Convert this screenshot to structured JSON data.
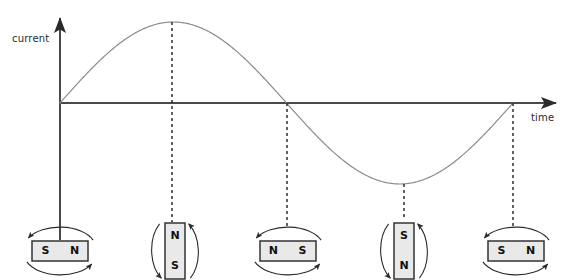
{
  "figure": {
    "background": "#ffffff",
    "width": 578,
    "height": 280
  },
  "axes": {
    "y_label": "current",
    "x_label": "time",
    "origin": {
      "x": 60,
      "y": 103
    },
    "x_axis_end": {
      "x": 562,
      "y": 103
    },
    "y_axis_top": {
      "x": 60,
      "y": 14
    },
    "y_axis_bottom": {
      "x": 60,
      "y": 240
    },
    "axis_color": "#4a4a4a",
    "axis_width": 2,
    "arrow_color": "#2b2b2b"
  },
  "chart_data": {
    "type": "line",
    "xlabel": "time",
    "ylabel": "current",
    "grid": false,
    "legend": null,
    "xlim": [
      0,
      360
    ],
    "ylim": [
      -1,
      1
    ],
    "x_tick_labels": [],
    "y_tick_labels": [],
    "curve_color": "#8a8a8a",
    "curve_width": 1.2,
    "series": [
      {
        "name": "current",
        "function": "sine",
        "amplitude": 1,
        "cycles": 1,
        "phase_deg": 0,
        "x": [
          0,
          45,
          90,
          135,
          180,
          225,
          270,
          315,
          360
        ],
        "y": [
          0,
          0.707,
          1,
          0.707,
          0,
          -0.707,
          -1,
          -0.707,
          0
        ]
      }
    ],
    "key_points": [
      {
        "label": "zero-rising",
        "x_deg": 0,
        "value": 0,
        "px": [
          60,
          103
        ]
      },
      {
        "label": "peak",
        "x_deg": 90,
        "value": 1,
        "px": [
          172,
          22
        ]
      },
      {
        "label": "zero-falling",
        "x_deg": 180,
        "value": 0,
        "px": [
          287,
          103
        ]
      },
      {
        "label": "trough",
        "x_deg": 270,
        "value": -1,
        "px": [
          404,
          184
        ]
      },
      {
        "label": "zero-rising",
        "x_deg": 360,
        "value": 0,
        "px": [
          513,
          103
        ]
      }
    ]
  },
  "dashed_guides": {
    "color": "#1f1f1f",
    "dash": "3,3",
    "lines": [
      {
        "x": 172,
        "y_from": 22,
        "y_to": 222
      },
      {
        "x": 287,
        "y_from": 103,
        "y_to": 228
      },
      {
        "x": 404,
        "y_from": 184,
        "y_to": 218
      },
      {
        "x": 513,
        "y_from": 103,
        "y_to": 228
      }
    ]
  },
  "magnet_style": {
    "fill": "#e9e9e9",
    "border": "#333333",
    "border_width": 1.5,
    "arrow_color": "#2b2b2b",
    "rotation": "clockwise"
  },
  "magnets": [
    {
      "id": "magnet-0deg",
      "orientation": "horizontal",
      "angle_deg": 0,
      "left_pole": "S",
      "right_pole": "N",
      "top_pole": "",
      "bottom_pole": "",
      "center": {
        "x": 60,
        "y": 251
      },
      "box": {
        "w": 56,
        "h": 20
      }
    },
    {
      "id": "magnet-90deg",
      "orientation": "vertical",
      "angle_deg": 90,
      "left_pole": "",
      "right_pole": "",
      "top_pole": "N",
      "bottom_pole": "S",
      "center": {
        "x": 175,
        "y": 251
      },
      "box": {
        "w": 20,
        "h": 56
      }
    },
    {
      "id": "magnet-180deg",
      "orientation": "horizontal",
      "angle_deg": 180,
      "left_pole": "N",
      "right_pole": "S",
      "top_pole": "",
      "bottom_pole": "",
      "center": {
        "x": 288,
        "y": 251
      },
      "box": {
        "w": 56,
        "h": 20
      }
    },
    {
      "id": "magnet-270deg",
      "orientation": "vertical",
      "angle_deg": 270,
      "left_pole": "",
      "right_pole": "",
      "top_pole": "S",
      "bottom_pole": "N",
      "center": {
        "x": 404,
        "y": 251
      },
      "box": {
        "w": 20,
        "h": 56
      }
    },
    {
      "id": "magnet-360deg",
      "orientation": "horizontal",
      "angle_deg": 360,
      "left_pole": "S",
      "right_pole": "N",
      "top_pole": "",
      "bottom_pole": "",
      "center": {
        "x": 516,
        "y": 251
      },
      "box": {
        "w": 56,
        "h": 20
      }
    }
  ]
}
